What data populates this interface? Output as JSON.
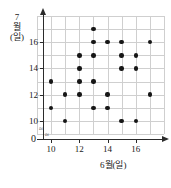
{
  "chart_data": {
    "type": "scatter",
    "title": "",
    "xlabel": "6월(일)",
    "ylabel": "7월(일)",
    "xlim": [
      9,
      18
    ],
    "ylim": [
      9,
      18
    ],
    "xticks": [
      10,
      12,
      14,
      16
    ],
    "yticks": [
      10,
      12,
      14,
      16
    ],
    "xtick_labels": [
      "10",
      "12",
      "14",
      "16"
    ],
    "ytick_labels": [
      "10",
      "12",
      "14",
      "16"
    ],
    "origin_label": "0",
    "grid": true,
    "grid_step": 1,
    "legend": null,
    "point_color": "#161616",
    "grid_color": "#cfcfcf",
    "axis_color": "#2b2b2b",
    "axis_break_symbol": "≈",
    "n_points": 25,
    "points": [
      {
        "x": 13,
        "y": 17
      },
      {
        "x": 13,
        "y": 16
      },
      {
        "x": 14,
        "y": 16
      },
      {
        "x": 15,
        "y": 16
      },
      {
        "x": 17,
        "y": 16
      },
      {
        "x": 12,
        "y": 15
      },
      {
        "x": 13,
        "y": 15
      },
      {
        "x": 15,
        "y": 15
      },
      {
        "x": 16,
        "y": 15
      },
      {
        "x": 12,
        "y": 14
      },
      {
        "x": 15,
        "y": 14
      },
      {
        "x": 16,
        "y": 14
      },
      {
        "x": 10,
        "y": 13
      },
      {
        "x": 12,
        "y": 13
      },
      {
        "x": 13,
        "y": 13
      },
      {
        "x": 11,
        "y": 12
      },
      {
        "x": 12,
        "y": 12
      },
      {
        "x": 14,
        "y": 12
      },
      {
        "x": 17,
        "y": 12
      },
      {
        "x": 10,
        "y": 11
      },
      {
        "x": 13,
        "y": 11
      },
      {
        "x": 14,
        "y": 11
      },
      {
        "x": 11,
        "y": 10
      },
      {
        "x": 15,
        "y": 10
      },
      {
        "x": 16,
        "y": 10
      }
    ]
  },
  "axes": {
    "y_title_lines": [
      "7",
      "월",
      "(일)"
    ],
    "x_title": "6월(일)",
    "origin": "0"
  }
}
